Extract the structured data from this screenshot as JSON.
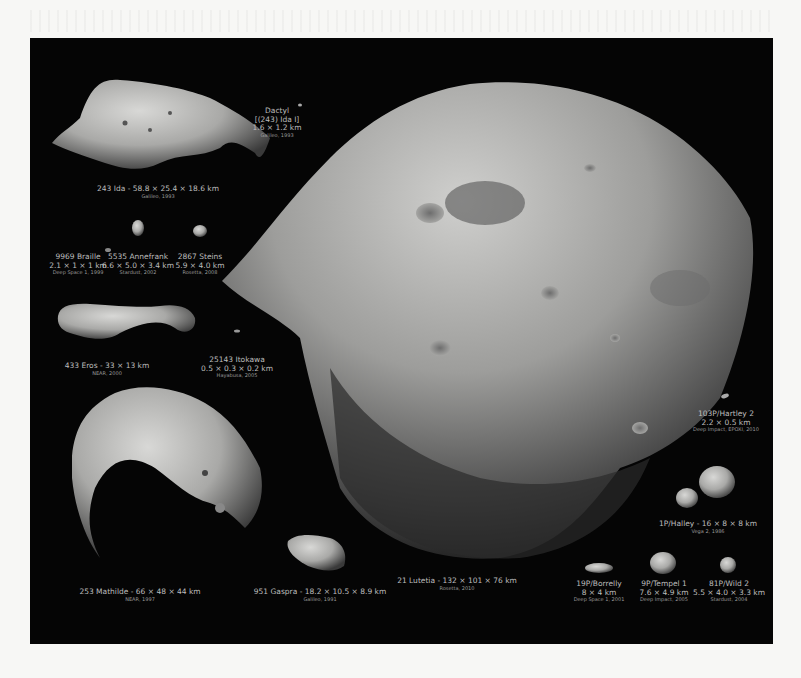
{
  "figure": {
    "background": "#050505",
    "page_background": "#f7f7f5",
    "caption_color": "#bdbdbd",
    "objects": [
      {
        "id": "dactyl",
        "name": "Dactyl",
        "alt_name": "[(243) Ida I]",
        "dims": "1.6 × 1.2 km",
        "mission": "Galileo, 1993"
      },
      {
        "id": "ida",
        "name": "243 Ida",
        "dims": "58.8 × 25.4 × 18.6 km",
        "label": "243 Ida - 58.8 × 25.4 × 18.6 km",
        "mission": "Galileo, 1993"
      },
      {
        "id": "braille",
        "name": "9969 Braille",
        "dims": "2.1 × 1 × 1 km",
        "mission": "Deep Space 1, 1999"
      },
      {
        "id": "annefrank",
        "name": "5535 Annefrank",
        "dims": "6.6 × 5.0 × 3.4 km",
        "mission": "Stardust, 2002"
      },
      {
        "id": "steins",
        "name": "2867 Steins",
        "dims": "5.9 × 4.0 km",
        "mission": "Rosetta, 2008"
      },
      {
        "id": "eros",
        "name": "433 Eros",
        "dims": "33 × 13 km",
        "label": "433 Eros - 33 × 13 km",
        "mission": "NEAR, 2000"
      },
      {
        "id": "itokawa",
        "name": "25143 Itokawa",
        "dims": "0.5 × 0.3 × 0.2 km",
        "mission": "Hayabusa, 2005"
      },
      {
        "id": "mathilde",
        "name": "253 Mathilde",
        "dims": "66 × 48 × 44 km",
        "label": "253 Mathilde - 66 × 48 × 44 km",
        "mission": "NEAR, 1997"
      },
      {
        "id": "gaspra",
        "name": "951 Gaspra",
        "dims": "18.2 × 10.5 × 8.9 km",
        "label": "951 Gaspra - 18.2 × 10.5 × 8.9 km",
        "mission": "Galileo, 1991"
      },
      {
        "id": "lutetia",
        "name": "21 Lutetia",
        "dims": "132 × 101 × 76 km",
        "label": "21 Lutetia - 132 × 101 × 76 km",
        "mission": "Rosetta, 2010"
      },
      {
        "id": "hartley2",
        "name": "103P/Hartley 2",
        "dims": "2.2 × 0.5 km",
        "mission": "Deep Impact, EPOXI, 2010"
      },
      {
        "id": "halley",
        "name": "1P/Halley",
        "dims": "16 × 8 × 8 km",
        "label": "1P/Halley - 16 × 8 × 8 km",
        "mission": "Vega 2, 1986"
      },
      {
        "id": "borrelly",
        "name": "19P/Borrelly",
        "dims": "8 × 4 km",
        "mission": "Deep Space 1, 2001"
      },
      {
        "id": "tempel1",
        "name": "9P/Tempel 1",
        "dims": "7.6 × 4.9 km",
        "mission": "Deep Impact, 2005"
      },
      {
        "id": "wild2",
        "name": "81P/Wild 2",
        "dims": "5.5 × 4.0 × 3.3 km",
        "mission": "Stardust, 2004"
      }
    ]
  }
}
